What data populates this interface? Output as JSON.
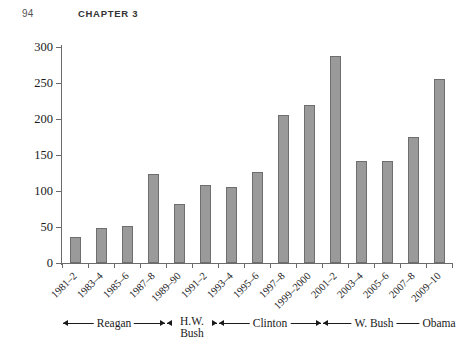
{
  "page": {
    "folio": "94",
    "chapter_title": "CHAPTER 3"
  },
  "chart_data": {
    "type": "bar",
    "title": "",
    "subtitle": "",
    "xlabel": "",
    "ylabel": "",
    "ylim": [
      0,
      300
    ],
    "yticks": [
      0,
      50,
      100,
      150,
      200,
      250,
      300
    ],
    "ytick_labels": [
      "0",
      "50",
      "100",
      "150",
      "200",
      "250",
      "300"
    ],
    "grid": false,
    "legend": false,
    "bar_fill_color": "#9a9a9a",
    "bar_edge_color": "#6e6e6e",
    "axis_color": "#6b6b6b",
    "categories": [
      "1981–2",
      "1983–4",
      "1985–6",
      "1987–8",
      "1989–90",
      "1991–2",
      "1993–4",
      "1995–6",
      "1997–8",
      "1999–2000",
      "2001–2",
      "2003–4",
      "2005–6",
      "2007–8",
      "2009–10"
    ],
    "values": [
      36,
      49,
      51,
      123,
      82,
      109,
      105,
      126,
      206,
      220,
      287,
      141,
      141,
      175,
      256
    ],
    "groups": [
      {
        "label": "Reagan",
        "start_index": 0,
        "end_index": 3,
        "two_line": false
      },
      {
        "label": "H.W. Bush",
        "start_index": 4,
        "end_index": 5,
        "two_line": true
      },
      {
        "label": "Clinton",
        "start_index": 6,
        "end_index": 9,
        "two_line": false
      },
      {
        "label": "W. Bush",
        "start_index": 10,
        "end_index": 13,
        "two_line": false
      },
      {
        "label": "Obama",
        "start_index": 14,
        "end_index": 14,
        "two_line": false
      }
    ]
  }
}
